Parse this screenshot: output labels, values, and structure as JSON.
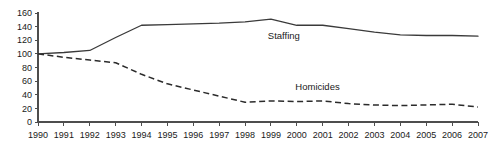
{
  "chart_data": {
    "type": "line",
    "title": "",
    "xlabel": "",
    "ylabel": "",
    "categories": [
      "1990",
      "1991",
      "1992",
      "1993",
      "1994",
      "1995",
      "1996",
      "1997",
      "1998",
      "1999",
      "2000",
      "2001",
      "2002",
      "2003",
      "2004",
      "2005",
      "2006",
      "2007"
    ],
    "x": [
      1990,
      1991,
      1992,
      1993,
      1994,
      1995,
      1996,
      1997,
      1998,
      1999,
      2000,
      2001,
      2002,
      2003,
      2004,
      2005,
      2006,
      2007
    ],
    "series": [
      {
        "name": "Staffing",
        "style": "solid",
        "color": "#3a3a3a",
        "label_x": 1999.5,
        "label_y": 122,
        "values": [
          100,
          102,
          105,
          124,
          142,
          143,
          144,
          145,
          147,
          151,
          142,
          142,
          137,
          132,
          128,
          127,
          127,
          126
        ]
      },
      {
        "name": "Homicides",
        "style": "dashed",
        "color": "#2b2b2b",
        "label_x": 2000.8,
        "label_y": 47,
        "values": [
          100,
          95,
          91,
          87,
          70,
          56,
          47,
          38,
          29,
          31,
          30,
          31,
          27,
          25,
          24,
          25,
          26,
          22
        ]
      }
    ],
    "yticks": [
      0,
      20,
      40,
      60,
      80,
      100,
      120,
      140,
      160
    ],
    "ytick_labels": [
      "0",
      "20",
      "40",
      "60",
      "80",
      "100",
      "120",
      "140",
      "160"
    ],
    "xtick_labels": [
      "1990",
      "1991",
      "1992",
      "1993",
      "1994",
      "1995",
      "1996",
      "1997",
      "1998",
      "1999",
      "2000",
      "2001",
      "2002",
      "2003",
      "2004",
      "2005",
      "2006",
      "2007"
    ],
    "ylim": [
      0,
      160
    ],
    "xlim": [
      1990,
      2007
    ],
    "grid": false,
    "legend_position": "inline-labels",
    "axis_color": "#4d4d4d",
    "background": "#ffffff"
  }
}
